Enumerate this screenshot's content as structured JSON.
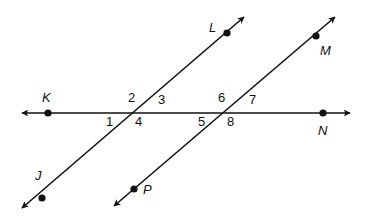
{
  "diagram": {
    "colors": {
      "line": "#111111",
      "background": "#ffffff"
    },
    "lines": [
      {
        "name": "KN",
        "from": [
          22,
          113
        ],
        "to": [
          350,
          113
        ]
      },
      {
        "name": "LJ",
        "from": [
          244,
          17
        ],
        "to": [
          22,
          208
        ]
      },
      {
        "name": "MP",
        "from": [
          335,
          17
        ],
        "to": [
          114,
          206
        ]
      }
    ],
    "points": [
      {
        "id": "K",
        "label": "K",
        "dot": [
          48,
          113
        ],
        "label_pos": [
          42,
          102
        ]
      },
      {
        "id": "N",
        "label": "N",
        "dot": [
          323,
          113
        ],
        "label_pos": [
          318,
          135
        ]
      },
      {
        "id": "L",
        "label": "L",
        "dot": [
          227,
          33
        ],
        "label_pos": [
          209,
          32
        ]
      },
      {
        "id": "M",
        "label": "M",
        "dot": [
          316,
          36
        ],
        "label_pos": [
          320,
          55
        ]
      },
      {
        "id": "J",
        "label": "J",
        "dot": [
          42,
          198
        ],
        "label_pos": [
          35,
          180
        ]
      },
      {
        "id": "P",
        "label": "P",
        "dot": [
          134,
          189
        ],
        "label_pos": [
          143,
          194
        ]
      }
    ],
    "angles": [
      {
        "label": "1",
        "pos": [
          106,
          126
        ]
      },
      {
        "label": "2",
        "pos": [
          128,
          102
        ]
      },
      {
        "label": "3",
        "pos": [
          158,
          104
        ]
      },
      {
        "label": "4",
        "pos": [
          135,
          126
        ]
      },
      {
        "label": "5",
        "pos": [
          198,
          126
        ]
      },
      {
        "label": "6",
        "pos": [
          218,
          102
        ]
      },
      {
        "label": "7",
        "pos": [
          249,
          104
        ]
      },
      {
        "label": "8",
        "pos": [
          227,
          126
        ]
      }
    ]
  }
}
